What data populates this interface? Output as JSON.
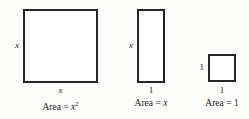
{
  "diagram": {
    "type": "algebra-tiles",
    "background_color": "#fdfdfc",
    "stroke_color": "#262626",
    "fill_color": "#ffffff",
    "tiles": [
      {
        "id": "square-x",
        "shape": "square",
        "side_label": "x",
        "bottom_label": "x",
        "caption_prefix": "Area =",
        "caption_value": "x",
        "caption_exponent": "2",
        "caption_full": "Area = x2"
      },
      {
        "id": "rect-x",
        "shape": "rectangle",
        "side_label": "x",
        "bottom_label": "1",
        "caption_prefix": "Area =",
        "caption_value": "x",
        "caption_exponent": "",
        "caption_full": "Area = x"
      },
      {
        "id": "square-1",
        "shape": "square",
        "side_label": "1",
        "bottom_label": "1",
        "caption_prefix": "Area =",
        "caption_value": "1",
        "caption_exponent": "",
        "caption_full": "Area = 1"
      }
    ]
  }
}
